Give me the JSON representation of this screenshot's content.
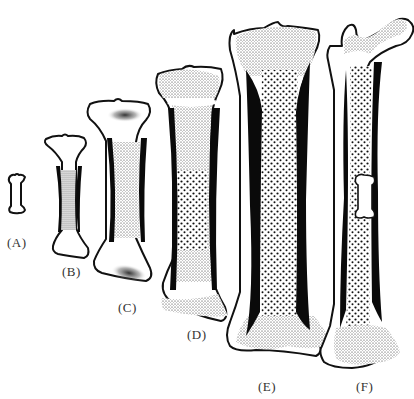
{
  "figure": {
    "type": "diagram",
    "panels": [
      {
        "id": "A",
        "label": "(A)"
      },
      {
        "id": "B",
        "label": "(B)"
      },
      {
        "id": "C",
        "label": "(C)"
      },
      {
        "id": "D",
        "label": "(D)"
      },
      {
        "id": "E",
        "label": "(E)"
      },
      {
        "id": "F",
        "label": "(F)"
      }
    ],
    "colors": {
      "background": "#ffffff",
      "outline": "#111111",
      "cortical_bone": "#0a0a0a",
      "stipple": "#222222",
      "label_text": "#333333"
    }
  }
}
